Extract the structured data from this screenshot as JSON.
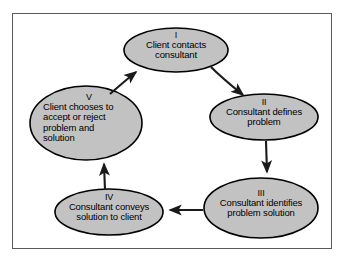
{
  "figure": {
    "background_color": "#ffffff",
    "frame_border_color": "#595959",
    "node_fill_color": "#c2c2c2",
    "node_stroke_color": "#000000",
    "arrow_color": "#1a1a1a"
  },
  "nodes": [
    {
      "id": "node-1",
      "numeral": "I",
      "lines": [
        "Client contacts",
        "consultant"
      ],
      "text_align": "center",
      "cx": 176,
      "cy": 50,
      "rx": 52,
      "ry": 22
    },
    {
      "id": "node-2",
      "numeral": "II",
      "lines": [
        "Consultant defines",
        "problem"
      ],
      "text_align": "center",
      "cx": 264,
      "cy": 117,
      "rx": 54,
      "ry": 23
    },
    {
      "id": "node-3",
      "numeral": "III",
      "lines": [
        "Consultant identifies",
        "problem solution"
      ],
      "text_align": "center",
      "cx": 261,
      "cy": 208,
      "rx": 57,
      "ry": 30
    },
    {
      "id": "node-4",
      "numeral": "IV",
      "lines": [
        "Consultant conveys",
        "solution to client"
      ],
      "text_align": "center",
      "cx": 109,
      "cy": 212,
      "rx": 54,
      "ry": 23
    },
    {
      "id": "node-5",
      "numeral": "V",
      "lines": [
        "Client chooses to",
        "accept or reject",
        "problem and",
        "solution"
      ],
      "text_align": "left",
      "cx": 86,
      "cy": 123,
      "rx": 56,
      "ry": 37
    }
  ],
  "arrows": [
    {
      "id": "arrow-1-to-2",
      "from": "node-1",
      "to": "node-2",
      "direction": "down-right"
    },
    {
      "id": "arrow-2-to-3",
      "from": "node-2",
      "to": "node-3",
      "direction": "down"
    },
    {
      "id": "arrow-3-to-4",
      "from": "node-3",
      "to": "node-4",
      "direction": "left"
    },
    {
      "id": "arrow-4-to-5",
      "from": "node-4",
      "to": "node-5",
      "direction": "up"
    },
    {
      "id": "arrow-5-to-1",
      "from": "node-5",
      "to": "node-1",
      "direction": "up-right"
    }
  ]
}
